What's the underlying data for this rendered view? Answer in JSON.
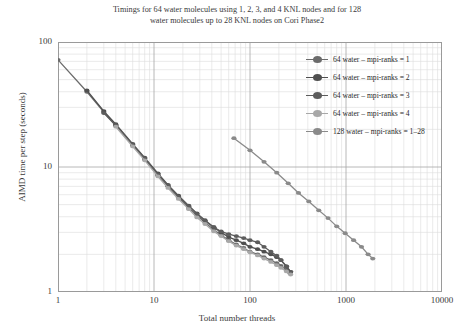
{
  "chart_data": {
    "type": "line",
    "title": "Timings for 64 water molecules using 1, 2, 3, and 4 KNL nodes and for 128 water molecules up to 28 KNL nodes on Cori Phase2",
    "title_line1": "Timings for 64 water molecules using 1, 2, 3, and 4 KNL nodes and for 128",
    "title_line2": "water molecules up to 28 KNL nodes on Cori Phase2",
    "xlabel": "Total number threads",
    "ylabel": "AIMD time per step (seconds)",
    "xscale": "log",
    "yscale": "log",
    "xlim": [
      1,
      10000
    ],
    "ylim": [
      1,
      100
    ],
    "grid": true,
    "minor_grid": true,
    "legend_position": "upper-right",
    "xticks": [
      "1",
      "10",
      "100",
      "1000",
      "10000"
    ],
    "xtick_values": [
      1,
      10,
      100,
      1000,
      10000
    ],
    "yticks": [
      "1",
      "10",
      "100"
    ],
    "ytick_values": [
      1,
      10,
      100
    ],
    "series": [
      {
        "name": "64 water – mpi-ranks = 1",
        "color": "#6b6b6b",
        "x": [
          1,
          2,
          3,
          4,
          6,
          8,
          11,
          14,
          18,
          23,
          28,
          34,
          42,
          50,
          60,
          72,
          86,
          100,
          120,
          140,
          165,
          190,
          210,
          240,
          260
        ],
        "y": [
          72,
          40,
          27.5,
          21.5,
          15.0,
          11.6,
          8.6,
          7.0,
          5.7,
          4.7,
          4.1,
          3.6,
          3.15,
          2.85,
          2.6,
          2.4,
          2.25,
          2.1,
          2.0,
          1.9,
          1.8,
          1.7,
          1.62,
          1.5,
          1.42
        ]
      },
      {
        "name": "64 water – mpi-ranks = 2",
        "color": "#4f4f4f",
        "x": [
          2,
          3,
          4,
          6,
          8,
          11,
          14,
          18,
          23,
          28,
          34,
          42,
          50,
          60,
          72,
          86,
          100,
          120,
          140,
          165,
          190,
          210,
          240,
          265
        ],
        "y": [
          41,
          28,
          22,
          15.3,
          11.9,
          8.9,
          7.2,
          5.9,
          4.9,
          4.25,
          3.75,
          3.3,
          3.0,
          2.75,
          2.6,
          2.45,
          2.3,
          2.2,
          2.1,
          2.0,
          1.9,
          1.8,
          1.6,
          1.45
        ]
      },
      {
        "name": "64 water – mpi-ranks = 3",
        "color": "#5c5c5c",
        "x": [
          3,
          4,
          6,
          8,
          11,
          14,
          18,
          23,
          28,
          34,
          42,
          50,
          60,
          72,
          86,
          100,
          120,
          140,
          165,
          190,
          210,
          240,
          265
        ],
        "y": [
          27,
          21.5,
          15.0,
          11.7,
          8.7,
          7.1,
          5.8,
          4.85,
          4.2,
          3.7,
          3.3,
          3.05,
          2.9,
          2.8,
          2.7,
          2.6,
          2.5,
          2.3,
          2.1,
          1.95,
          1.8,
          1.6,
          1.45
        ]
      },
      {
        "name": "64 water – mpi-ranks = 4",
        "color": "#a8a8a8",
        "x": [
          4,
          6,
          8,
          11,
          14,
          18,
          23,
          28,
          34,
          42,
          50,
          60,
          72,
          86,
          100,
          120,
          140,
          165,
          190,
          210,
          240,
          265
        ],
        "y": [
          21,
          14.6,
          11.3,
          8.4,
          6.8,
          5.55,
          4.6,
          3.95,
          3.5,
          3.05,
          2.8,
          2.55,
          2.35,
          2.2,
          2.08,
          1.96,
          1.85,
          1.74,
          1.64,
          1.56,
          1.46,
          1.38
        ]
      },
      {
        "name": "128 water – mpi-ranks = 1–28",
        "color": "#8a8a8a",
        "x": [
          68,
          100,
          140,
          190,
          250,
          320,
          410,
          520,
          650,
          800,
          980,
          1200,
          1450,
          1700,
          1900
        ],
        "y": [
          17.0,
          13.6,
          11.0,
          9.0,
          7.4,
          6.2,
          5.3,
          4.5,
          3.9,
          3.35,
          2.95,
          2.6,
          2.3,
          2.0,
          1.85
        ]
      }
    ]
  }
}
